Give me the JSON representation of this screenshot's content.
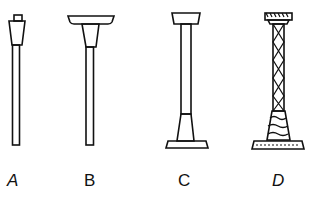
{
  "figures": [
    {
      "id": "A",
      "label": "A",
      "description": "Narrow column with small block top, tapered capital, thin shaft, no base"
    },
    {
      "id": "B",
      "label": "B",
      "description": "Column with wide flat slab top, tapered capital, thin shaft, no base"
    },
    {
      "id": "C",
      "label": "C",
      "description": "Column with block top, plain shaft, tapered plinth and flat base"
    },
    {
      "id": "D",
      "label": "D",
      "description": "Ornate column with decorated capital, twisted lattice shaft, foliate base and flat base"
    }
  ],
  "colors": {
    "ink": "#111111",
    "background": "#ffffff"
  }
}
